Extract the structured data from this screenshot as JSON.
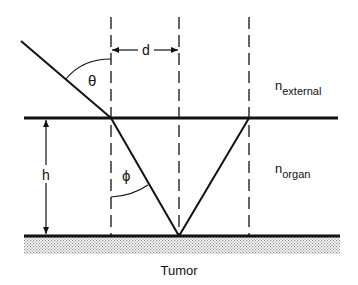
{
  "diagram": {
    "labels": {
      "theta": "θ",
      "phi": "ϕ",
      "d": "d",
      "h": "h",
      "n_external_base": "n",
      "n_external_sub": "external",
      "n_organ_base": "n",
      "n_organ_sub": "organ",
      "tumor": "Tumor"
    },
    "colors": {
      "line": "#111111",
      "stipple": "#9a9a9a",
      "background": "#ffffff"
    }
  }
}
